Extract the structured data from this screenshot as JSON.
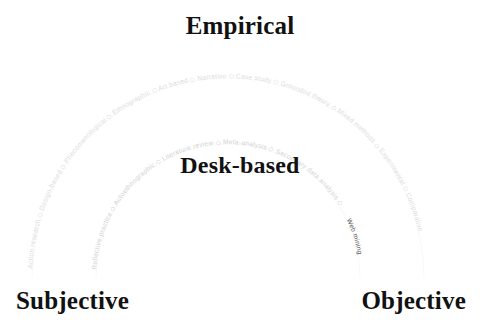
{
  "diagram": {
    "type": "arc-spectrum",
    "title_top": "Empirical",
    "title_middle": "Desk-based",
    "axis_left": "Subjective",
    "axis_right": "Objective",
    "separator": "◇",
    "colors": {
      "heading_text": "#111111",
      "outer_arc_text": "#dcdcdc",
      "inner_arc_text": "#d2d2d2",
      "highlight_text": "#585858",
      "background": "#ffffff"
    },
    "outer_arc": {
      "name": "Empirical",
      "methods": [
        "Action research",
        "Design-based",
        "Phenomenological",
        "Ethnographic",
        "Art based",
        "Narrative",
        "Case study",
        "Grounded theory",
        "Mixed methods",
        "Experimental",
        "Comparative"
      ],
      "joined": "Action research ◇ Design-based ◇ Phenomenological ◇ Ethnographic ◇ Art based ◇ Narrative ◇ Case study ◇ Grounded theory ◇ Mixed methods ◇ Experimental ◇ Comparative"
    },
    "inner_arc": {
      "name": "Desk-based",
      "methods": [
        "Reflective practice",
        "Autoethnographic",
        "Literature review",
        "Meta-analysis",
        "Secondary data analysis",
        "Web mining"
      ],
      "joined_before_highlight": "Reflective practice ◇ Autoethnographic ◇ Literature review ◇ Meta-analysis ◇ Secondary data analysis ◇ ",
      "highlight": "Web mining"
    }
  }
}
